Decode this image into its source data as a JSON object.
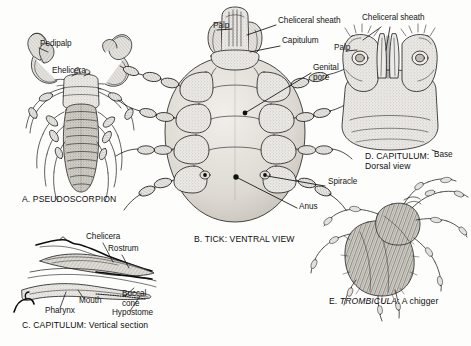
{
  "figure": {
    "background_color": "#fdfdfc",
    "ink_color": "#151515",
    "fill_light": "#e8e7e3",
    "fill_mid": "#cfcdc7",
    "fill_dark": "#a8a59d"
  },
  "panels": [
    {
      "id": "A",
      "caption": "A.  PSEUDOSCORPION",
      "caption_x": 22,
      "caption_y": 199,
      "labels": [
        {
          "name": "pedipalp",
          "text": "Pedipalp",
          "x": 40,
          "y": 44
        },
        {
          "name": "chelicera",
          "text": "Ehelicera",
          "x": 52,
          "y": 71
        }
      ]
    },
    {
      "id": "B",
      "caption": "B. TICK: VENTRAL VIEW",
      "caption_x": 194,
      "caption_y": 239,
      "labels": [
        {
          "name": "palp",
          "text": "Palp",
          "x": 213,
          "y": 26
        },
        {
          "name": "cheliceral-sheath",
          "text": "Cheliceral sheath",
          "x": 278,
          "y": 21
        },
        {
          "name": "capitulum",
          "text": "Capitulum",
          "x": 282,
          "y": 41
        },
        {
          "name": "genital-pore",
          "text": "Genital\npore",
          "x": 313,
          "y": 68
        },
        {
          "name": "spiracle",
          "text": "Spiracle",
          "x": 328,
          "y": 182
        },
        {
          "name": "anus",
          "text": "Anus",
          "x": 299,
          "y": 207
        }
      ]
    },
    {
      "id": "C",
      "caption": "C. CAPITULUM: Vertical section",
      "caption_x": 22,
      "caption_y": 325,
      "labels": [
        {
          "name": "chelicera",
          "text": "Chelicera",
          "x": 86,
          "y": 237
        },
        {
          "name": "rostrum",
          "text": "Rostrum",
          "x": 108,
          "y": 249
        },
        {
          "name": "mouth",
          "text": "Mouth",
          "x": 79,
          "y": 301
        },
        {
          "name": "pharynx",
          "text": "Pharynx",
          "x": 45,
          "y": 311
        },
        {
          "name": "buccal-cone",
          "text": "Buccal\ncone",
          "x": 122,
          "y": 294
        },
        {
          "name": "hypostome",
          "text": "Hypostome",
          "x": 112,
          "y": 313
        }
      ]
    },
    {
      "id": "D",
      "caption": "D. CAPITULUM:\nDorsal view",
      "caption_x": 365,
      "caption_y": 157,
      "labels": [
        {
          "name": "cheliceral-sheath",
          "text": "Cheliceral sheath",
          "x": 362,
          "y": 18
        },
        {
          "name": "palp",
          "text": "Palp",
          "x": 334,
          "y": 48
        },
        {
          "name": "base",
          "text": "Base",
          "x": 434,
          "y": 155
        }
      ]
    },
    {
      "id": "E",
      "caption_prefix": "E. ",
      "caption_genus": "TROMBICULA",
      "caption_suffix": ": A chigger",
      "caption_x": 329,
      "caption_y": 301,
      "labels": []
    }
  ]
}
